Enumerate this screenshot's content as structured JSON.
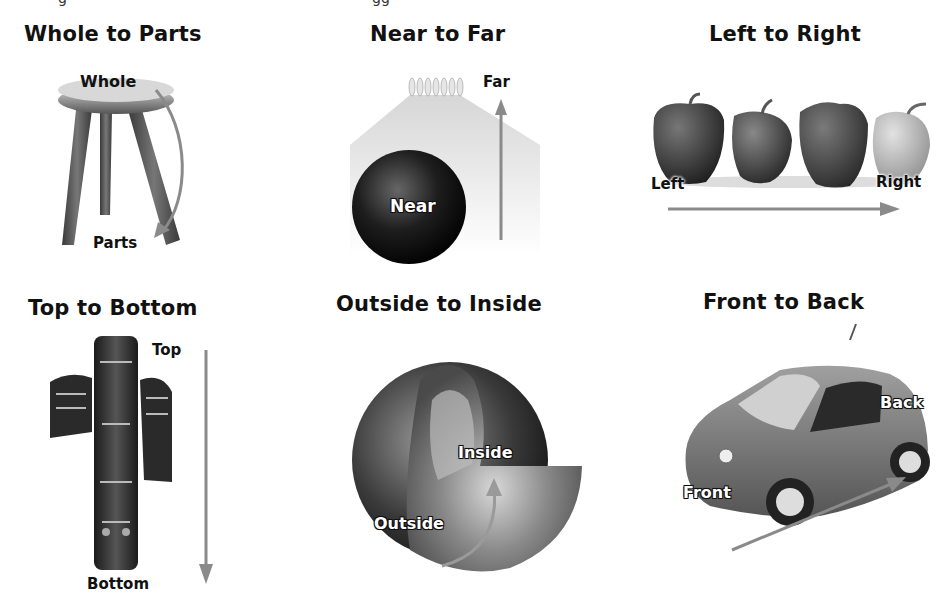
{
  "panels": [
    {
      "id": "whole-to-parts",
      "title": "Whole to Parts",
      "start_label": "Whole",
      "end_label": "Parts",
      "image": "three-legged-stool"
    },
    {
      "id": "near-to-far",
      "title": "Near to Far",
      "start_label": "Near",
      "end_label": "Far",
      "image": "bowling-ball-and-pins"
    },
    {
      "id": "left-to-right",
      "title": "Left to Right",
      "start_label": "Left",
      "end_label": "Right",
      "image": "row-of-peppers"
    },
    {
      "id": "top-to-bottom",
      "title": "Top to Bottom",
      "start_label": "Top",
      "end_label": "Bottom",
      "image": "totem-pole"
    },
    {
      "id": "outside-to-inside",
      "title": "Outside to Inside",
      "start_label": "Outside",
      "end_label": "Inside",
      "image": "earth-cross-section"
    },
    {
      "id": "front-to-back",
      "title": "Front to Back",
      "start_label": "Front",
      "end_label": "Back",
      "image": "small-car"
    }
  ],
  "colors": {
    "arrow": "#8a8a8a",
    "text": "#111111",
    "background": "#ffffff"
  }
}
